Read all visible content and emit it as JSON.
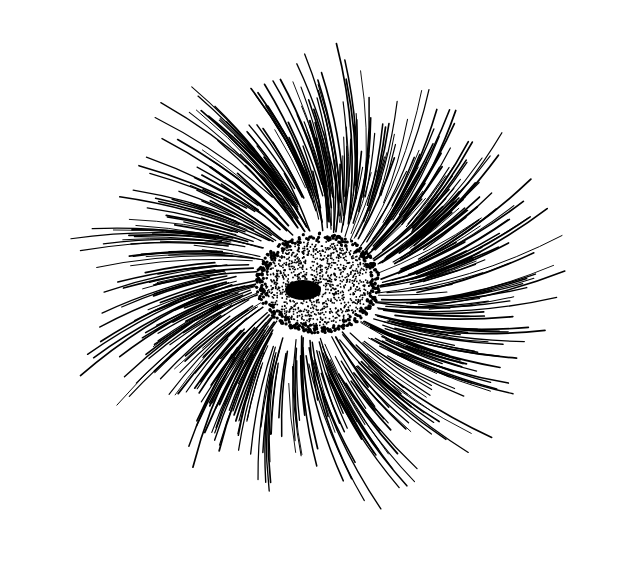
{
  "illustration": {
    "subject": "swirling radial hair strokes around a stippled spiral vortex",
    "style": "black pen-and-ink line drawing on white",
    "colors": {
      "background": "#ffffff",
      "ink": "#000000"
    },
    "center": {
      "x": 318,
      "y": 283
    },
    "spiral_core": {
      "rx": 62,
      "ry": 50,
      "inner_dark_x": 303,
      "inner_dark_y": 290
    },
    "strokes": {
      "count": 520,
      "inner_radius": 55,
      "outer_radius_min": 150,
      "outer_radius_max": 265,
      "twist": 0.55
    }
  }
}
